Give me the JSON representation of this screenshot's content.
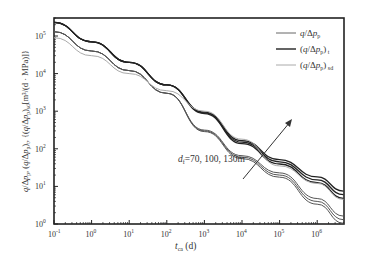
{
  "chart_data": {
    "type": "line",
    "title": "",
    "xlabel": "t_ca (d)",
    "ylabel": "q/Δp_p, (q/Δp_p)_t, (q/Δp_p)_sd [m³/(d·MPa)]",
    "xscale": "log",
    "yscale": "log",
    "xlim": [
      0.1,
      5000000
    ],
    "ylim": [
      1,
      300000
    ],
    "x_ticks": [
      "10^-1",
      "10^0",
      "10^1",
      "10^2",
      "10^3",
      "10^4",
      "10^5",
      "10^6"
    ],
    "y_ticks": [
      "10^0",
      "10^1",
      "10^2",
      "10^3",
      "10^4",
      "10^5"
    ],
    "grid": false,
    "legend_position": "upper right",
    "annotation": {
      "text": "d_f=70, 100, 130m",
      "arrow": "increasing d_f direction (upward-right)"
    },
    "series": [
      {
        "name": "q/Δp_p",
        "color": "#555555",
        "group": "lower bundle (3 curves)",
        "x": [
          0.1,
          1,
          10,
          100,
          1000,
          10000,
          100000,
          1000000,
          5000000
        ],
        "values": [
          130000,
          40000,
          12000,
          3000,
          300,
          60,
          20,
          4,
          1.3
        ]
      },
      {
        "name": "(q/Δp_p)_t",
        "color": "#222222",
        "group": "upper bundle (3 curves)",
        "x": [
          0.1,
          1,
          10,
          100,
          1000,
          10000,
          100000,
          1000000,
          5000000
        ],
        "values": [
          230000,
          70000,
          20000,
          5000,
          900,
          150,
          45,
          15,
          6
        ]
      },
      {
        "name": "(q/Δp_p)_sd",
        "color": "#aaaaaa",
        "group": "middle",
        "x": [
          0.1,
          1,
          10,
          100,
          1000,
          10000,
          100000,
          1000000,
          5000000
        ],
        "values": [
          90000,
          30000,
          10000,
          3500,
          1000,
          180,
          35,
          12,
          4.5
        ]
      }
    ]
  },
  "labels": {
    "legend": [
      "q/Δp",
      "(q/Δp",
      "(q/Δp"
    ],
    "annotation": "d",
    "xlabel_t": "t",
    "xlabel_unit": "(d)"
  }
}
